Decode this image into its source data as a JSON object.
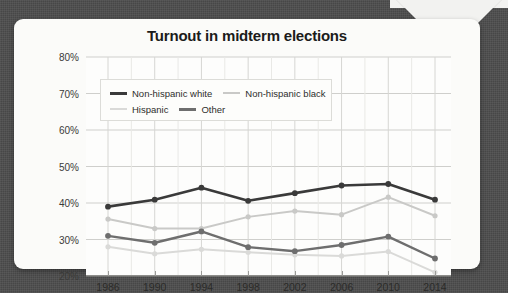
{
  "card": {
    "title": "Turnout in midterm elections"
  },
  "legend": {
    "items": [
      {
        "label": "Non-hispanic white",
        "color": "#3a3a3a",
        "width": 3
      },
      {
        "label": "Non-hispanic black",
        "color": "#c9c9c7",
        "width": 2
      },
      {
        "label": "Hispanic",
        "color": "#dadad8",
        "width": 2
      },
      {
        "label": "Other",
        "color": "#6e6e6e",
        "width": 3
      }
    ]
  },
  "axes": {
    "y_ticks": [
      "20%",
      "30%",
      "40%",
      "50%",
      "60%",
      "70%",
      "80%"
    ],
    "x_ticks": [
      "1986",
      "1990",
      "1994",
      "1998",
      "2002",
      "2006",
      "2010",
      "2014"
    ]
  },
  "chart_data": {
    "type": "line",
    "title": "Turnout in midterm elections",
    "xlabel": "",
    "ylabel": "",
    "ylim": [
      20,
      80
    ],
    "ytick_step": 10,
    "grid": true,
    "legend_position": "top-left-inside",
    "categories": [
      "1986",
      "1990",
      "1994",
      "1998",
      "2002",
      "2006",
      "2010",
      "2014"
    ],
    "series": [
      {
        "name": "Non-hispanic white",
        "color": "#3a3a3a",
        "values": [
          39.0,
          40.9,
          44.2,
          40.6,
          42.7,
          44.8,
          45.2,
          40.9
        ]
      },
      {
        "name": "Non-hispanic black",
        "color": "#c9c9c7",
        "values": [
          35.6,
          33.0,
          33.0,
          36.2,
          37.8,
          36.8,
          41.6,
          36.5
        ]
      },
      {
        "name": "Hispanic",
        "color": "#dadad8",
        "values": [
          28.0,
          26.1,
          27.3,
          26.5,
          25.8,
          25.5,
          26.7,
          21.0
        ]
      },
      {
        "name": "Other",
        "color": "#6e6e6e",
        "values": [
          31.0,
          29.1,
          32.2,
          27.9,
          26.8,
          28.5,
          30.8,
          24.8
        ]
      }
    ]
  }
}
